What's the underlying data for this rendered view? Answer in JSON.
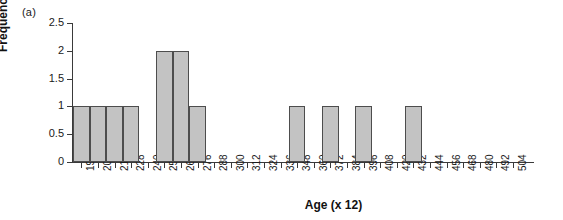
{
  "panel_label": "(a)",
  "chart_data": {
    "type": "bar",
    "title": "",
    "subtitle": "",
    "xlabel": "Age (x 12)",
    "ylabel": "Frequency",
    "categories": [
      "192",
      "204",
      "216",
      "228",
      "240",
      "252",
      "264",
      "276",
      "288",
      "300",
      "312",
      "324",
      "336",
      "348",
      "360",
      "372",
      "384",
      "396",
      "408",
      "420",
      "432",
      "444",
      "456",
      "468",
      "480",
      "492",
      "504"
    ],
    "values": [
      1,
      1,
      1,
      1,
      0,
      2,
      2,
      1,
      0,
      0,
      0,
      0,
      0,
      1,
      0,
      1,
      0,
      1,
      0,
      0,
      1,
      0,
      0,
      0,
      0,
      0,
      0
    ],
    "ylim": [
      0,
      2.5
    ],
    "yticks": [
      "0",
      "0.5",
      "1",
      "1.5",
      "2",
      "2.5"
    ],
    "ytick_values": [
      0,
      0.5,
      1,
      1.5,
      2,
      2.5
    ],
    "grid": false,
    "legend": "none",
    "bar_fill_color": "#c3c3c3",
    "bar_edge_color": "#4d4d4d",
    "axis_color": "#3a3a3a"
  }
}
